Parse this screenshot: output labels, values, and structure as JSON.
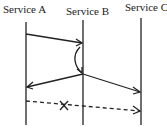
{
  "diagram": {
    "type": "sequence",
    "participants": [
      {
        "id": "A",
        "label": "Service A",
        "x": 26,
        "label_x": 3,
        "label_y": 3,
        "top": 22
      },
      {
        "id": "B",
        "label": "Service B",
        "x": 83,
        "label_x": 66,
        "label_y": 5,
        "top": 20
      },
      {
        "id": "C",
        "label": "Service C",
        "x": 141,
        "label_x": 125,
        "label_y": 1,
        "top": 18
      }
    ],
    "lifeline_bottom": 125,
    "messages": [
      {
        "from": "A",
        "to": "B",
        "style": "solid",
        "x1": 26,
        "y1": 34,
        "x2": 82,
        "y2": 43
      },
      {
        "from": "B",
        "to": "B",
        "style": "solid-curved",
        "x1": 80,
        "y1": 47,
        "x2": 82,
        "y2": 73
      },
      {
        "from": "B",
        "to": "A",
        "style": "solid",
        "x1": 83,
        "y1": 74,
        "x2": 27,
        "y2": 87
      },
      {
        "from": "B",
        "to": "C",
        "style": "solid",
        "x1": 83,
        "y1": 74,
        "x2": 140,
        "y2": 92
      },
      {
        "from": "A",
        "to": "C",
        "style": "dashed",
        "x1": 26,
        "y1": 101,
        "x2": 140,
        "y2": 111,
        "failed": true,
        "x_mark": {
          "x": 64,
          "y": 105
        }
      }
    ],
    "line_color": "#222222"
  }
}
